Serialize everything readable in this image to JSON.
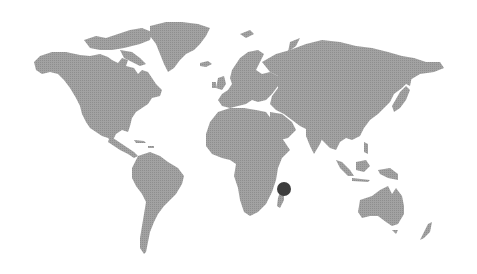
{
  "map": {
    "type": "world-map",
    "style": "dotted-halftone",
    "land_color": "#9a9a9a",
    "background_color": "#ffffff",
    "continents": [
      {
        "name": "North America"
      },
      {
        "name": "Greenland"
      },
      {
        "name": "South America"
      },
      {
        "name": "Europe"
      },
      {
        "name": "Africa"
      },
      {
        "name": "Asia"
      },
      {
        "name": "Australia"
      },
      {
        "name": "New Zealand"
      },
      {
        "name": "Madagascar"
      }
    ],
    "marker": {
      "label": "location-marker",
      "color": "#3d3d3d",
      "x": 284,
      "y": 189,
      "radius": 7,
      "near": "Madagascar"
    }
  }
}
